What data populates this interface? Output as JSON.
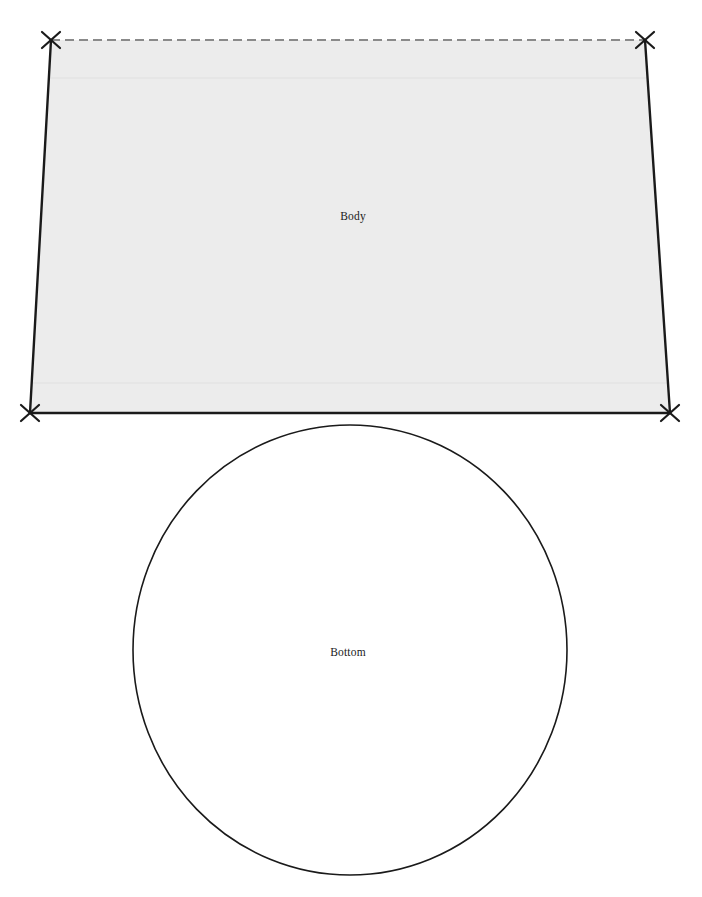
{
  "diagram": {
    "background_color": "#ffffff",
    "pieces": [
      {
        "id": "body",
        "label": "Body",
        "shape": "trapezoid",
        "fill_color": "#ececec",
        "stroke_color": "#1a1a1a",
        "label_x": 353,
        "label_y": 217,
        "corners": [
          {
            "name": "top-left",
            "x": 51,
            "y": 40
          },
          {
            "name": "top-right",
            "x": 645,
            "y": 40
          },
          {
            "name": "bottom-right",
            "x": 670,
            "y": 413
          },
          {
            "name": "bottom-left",
            "x": 30,
            "y": 413
          }
        ],
        "top_edge": {
          "style": "dashed",
          "color": "#8a8a8a",
          "dash": "9 5",
          "width": 2.2
        },
        "side_edges": {
          "style": "solid",
          "color": "#1a1a1a",
          "width": 2.4
        },
        "bottom_edge": {
          "style": "solid",
          "color": "#1a1a1a",
          "width": 2.4
        },
        "fold_lines": [
          {
            "name": "upper-fold",
            "y": 78,
            "color": "#e0e0e0"
          },
          {
            "name": "lower-fold",
            "y": 383,
            "color": "#e0e0e0"
          }
        ],
        "corner_markers": {
          "glyph": "x-cross-marker",
          "count": 4,
          "color": "#1a1a1a",
          "arm_length": 9,
          "width": 2.2
        }
      },
      {
        "id": "bottom",
        "label": "Bottom",
        "shape": "ellipse",
        "fill_color": "#ffffff",
        "stroke_color": "#1a1a1a",
        "stroke_width": 1.6,
        "center_x": 350,
        "center_y": 650,
        "radius_x": 217,
        "radius_y": 225,
        "label_x": 348,
        "label_y": 653
      }
    ]
  }
}
